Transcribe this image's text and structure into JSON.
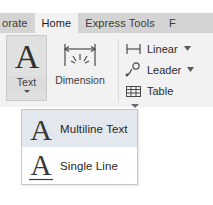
{
  "ribbon": {
    "tabs": [
      {
        "label": "orate",
        "state": "partial"
      },
      {
        "label": "Home",
        "state": "active"
      },
      {
        "label": "Express Tools",
        "state": "normal"
      },
      {
        "label": "F",
        "state": "clipped"
      }
    ],
    "panel": {
      "big_buttons": [
        {
          "id": "text",
          "label": "Text",
          "icon": "letter-a-icon",
          "has_dropdown": true,
          "selected": true
        },
        {
          "id": "dimension",
          "label": "Dimension",
          "icon": "dimension-icon",
          "has_dropdown": false,
          "selected": false
        }
      ],
      "small_buttons": [
        {
          "id": "linear",
          "label": "Linear",
          "icon": "linear-dimension-icon",
          "has_dropdown": true
        },
        {
          "id": "leader",
          "label": "Leader",
          "icon": "leader-icon",
          "has_dropdown": true
        },
        {
          "id": "table",
          "label": "Table",
          "icon": "table-grid-icon",
          "has_dropdown": false
        }
      ]
    }
  },
  "dropdown_menu": {
    "open": true,
    "items": [
      {
        "id": "multiline-text",
        "label": "Multiline Text",
        "icon": "letter-a-icon",
        "highlighted": true
      },
      {
        "id": "single-line",
        "label": "Single Line",
        "icon": "letter-a-underline-icon",
        "highlighted": false
      }
    ]
  },
  "colors": {
    "tabstrip_bg": "#d4d4d4",
    "active_tab_bg": "#f2f2f2",
    "panel_bg": "#f2f2f2",
    "selected_button_bg": "#e0e0e0",
    "menu_bg": "#ffffff",
    "menu_highlight_bg": "#e3e8ee",
    "text_primary": "#272727",
    "icon_stroke": "#3c3c3c"
  }
}
